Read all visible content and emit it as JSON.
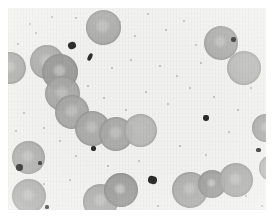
{
  "image": {
    "title": "Peripheral blood smear micrograph",
    "subject": "Red blood cells (erythrocytes)",
    "modality": "Brightfield light microscopy",
    "rendering": "grayscale",
    "width": 274,
    "height": 220,
    "field": {
      "x": 8,
      "y": 8,
      "width": 258,
      "height": 202
    },
    "colors": {
      "page_background": "#ffffff",
      "field_background": "#f1f1ef",
      "cell_fill": "#a9a9a7",
      "cell_fill_light": "#b9b9b7",
      "cell_rim": "#8d8d8b",
      "cell_center_pallor": "#bcbcba",
      "debris_dark": "#2a2a2a",
      "speck_gray": "#9d9d9b"
    }
  },
  "cells": [
    {
      "name": "cell-top-chain-head",
      "cx": 103,
      "cy": 27,
      "r": 17.5,
      "tone": "mid",
      "pallor": 0.52,
      "rot": -8
    },
    {
      "name": "cell-left-edge-upper",
      "cx": 10,
      "cy": 68,
      "r": 16.0,
      "tone": "mid",
      "pallor": 0.5,
      "rot": 12
    },
    {
      "name": "cell-chain-1",
      "cx": 47,
      "cy": 62,
      "r": 17.0,
      "tone": "mid",
      "pallor": 0.55,
      "rot": 0
    },
    {
      "name": "cell-chain-2",
      "cx": 60,
      "cy": 72,
      "r": 18.0,
      "tone": "dark",
      "pallor": 0.45,
      "rot": 5
    },
    {
      "name": "cell-chain-3",
      "cx": 62,
      "cy": 93,
      "r": 17.5,
      "tone": "mid",
      "pallor": 0.5,
      "rot": -6
    },
    {
      "name": "cell-chain-4",
      "cx": 72,
      "cy": 112,
      "r": 17.0,
      "tone": "mid",
      "pallor": 0.52,
      "rot": 10
    },
    {
      "name": "cell-chain-5",
      "cx": 92,
      "cy": 128,
      "r": 17.5,
      "tone": "mid",
      "pallor": 0.48,
      "rot": -4
    },
    {
      "name": "cell-chain-6",
      "cx": 116,
      "cy": 134,
      "r": 17.0,
      "tone": "mid",
      "pallor": 0.52,
      "rot": 6
    },
    {
      "name": "cell-chain-7",
      "cx": 140,
      "cy": 130,
      "r": 16.5,
      "tone": "light",
      "pallor": 0.55,
      "rot": 0
    },
    {
      "name": "cell-right-edge-mid",
      "cx": 266,
      "cy": 128,
      "r": 14.0,
      "tone": "mid",
      "pallor": 0.5,
      "rot": 0
    },
    {
      "name": "cell-upper-right-1",
      "cx": 221,
      "cy": 43,
      "r": 17.0,
      "tone": "mid",
      "pallor": 0.45,
      "rot": -10
    },
    {
      "name": "cell-upper-right-2",
      "cx": 244,
      "cy": 68,
      "r": 17.0,
      "tone": "light",
      "pallor": 0.58,
      "rot": 8
    },
    {
      "name": "cell-left-lower-1",
      "cx": 28,
      "cy": 157,
      "r": 16.5,
      "tone": "mid",
      "pallor": 0.5,
      "rot": 0
    },
    {
      "name": "cell-left-lower-2",
      "cx": 29,
      "cy": 196,
      "r": 17.0,
      "tone": "mid",
      "pallor": 0.48,
      "rot": -5
    },
    {
      "name": "cell-bottom-mid-1",
      "cx": 100,
      "cy": 201,
      "r": 17.5,
      "tone": "mid",
      "pallor": 0.5,
      "rot": 14
    },
    {
      "name": "cell-bottom-mid-2",
      "cx": 121,
      "cy": 190,
      "r": 17.0,
      "tone": "dark",
      "pallor": 0.42,
      "rot": -12
    },
    {
      "name": "cell-bottom-right-1",
      "cx": 190,
      "cy": 190,
      "r": 18.0,
      "tone": "mid",
      "pallor": 0.46,
      "rot": 6
    },
    {
      "name": "cell-bottom-right-2",
      "cx": 212,
      "cy": 184,
      "r": 14.0,
      "tone": "dark",
      "pallor": 0.4,
      "rot": 0
    },
    {
      "name": "cell-bottom-right-3",
      "cx": 236,
      "cy": 180,
      "r": 17.0,
      "tone": "mid",
      "pallor": 0.5,
      "rot": -8
    },
    {
      "name": "cell-right-edge-lower",
      "cx": 272,
      "cy": 168,
      "r": 13.0,
      "tone": "light",
      "pallor": 0.55,
      "rot": 0
    }
  ],
  "debris": [
    {
      "name": "debris-large-upper",
      "cx": 72,
      "cy": 45,
      "w": 8,
      "h": 7,
      "rot": -20,
      "shade": "#232323"
    },
    {
      "name": "debris-streak-upper",
      "cx": 90,
      "cy": 57,
      "w": 4,
      "h": 8,
      "rot": 25,
      "shade": "#2e2e2e"
    },
    {
      "name": "debris-square-left",
      "cx": 19,
      "cy": 167,
      "w": 7,
      "h": 7,
      "rot": 0,
      "shade": "#1f1f1f"
    },
    {
      "name": "debris-mid-right",
      "cx": 152,
      "cy": 180,
      "w": 9,
      "h": 8,
      "rot": 10,
      "shade": "#242424"
    },
    {
      "name": "debris-upper-right",
      "cx": 206,
      "cy": 118,
      "w": 6,
      "h": 6,
      "rot": 0,
      "shade": "#2a2a2a"
    },
    {
      "name": "debris-top-right",
      "cx": 233,
      "cy": 39,
      "w": 5,
      "h": 5,
      "rot": 0,
      "shade": "#303030"
    },
    {
      "name": "debris-right-mid",
      "cx": 258,
      "cy": 150,
      "w": 5,
      "h": 4,
      "rot": 0,
      "shade": "#2b2b2b"
    },
    {
      "name": "debris-lower-left",
      "cx": 40,
      "cy": 163,
      "w": 4,
      "h": 4,
      "rot": 0,
      "shade": "#333333"
    },
    {
      "name": "debris-center-low",
      "cx": 93,
      "cy": 148,
      "w": 5,
      "h": 5,
      "rot": 0,
      "shade": "#2c2c2c"
    },
    {
      "name": "debris-bottom-left",
      "cx": 47,
      "cy": 207,
      "w": 4,
      "h": 4,
      "rot": 0,
      "shade": "#3a3a3a"
    }
  ],
  "specks": [
    {
      "cx": 30,
      "cy": 24,
      "r": 1.4
    },
    {
      "cx": 52,
      "cy": 17,
      "r": 1.1
    },
    {
      "cx": 76,
      "cy": 18,
      "r": 1.0
    },
    {
      "cx": 18,
      "cy": 44,
      "r": 1.2
    },
    {
      "cx": 36,
      "cy": 33,
      "r": 1.0
    },
    {
      "cx": 120,
      "cy": 22,
      "r": 1.2
    },
    {
      "cx": 135,
      "cy": 36,
      "r": 1.1
    },
    {
      "cx": 148,
      "cy": 14,
      "r": 1.0
    },
    {
      "cx": 166,
      "cy": 30,
      "r": 1.3
    },
    {
      "cx": 184,
      "cy": 21,
      "r": 1.0
    },
    {
      "cx": 196,
      "cy": 45,
      "r": 1.2
    },
    {
      "cx": 201,
      "cy": 63,
      "r": 1.1
    },
    {
      "cx": 177,
      "cy": 76,
      "r": 1.0
    },
    {
      "cx": 160,
      "cy": 66,
      "r": 1.2
    },
    {
      "cx": 131,
      "cy": 60,
      "r": 1.1
    },
    {
      "cx": 112,
      "cy": 68,
      "r": 1.0
    },
    {
      "cx": 146,
      "cy": 92,
      "r": 1.2
    },
    {
      "cx": 168,
      "cy": 104,
      "r": 1.1
    },
    {
      "cx": 190,
      "cy": 88,
      "r": 1.0
    },
    {
      "cx": 214,
      "cy": 97,
      "r": 1.2
    },
    {
      "cx": 238,
      "cy": 110,
      "r": 1.1
    },
    {
      "cx": 251,
      "cy": 88,
      "r": 1.0
    },
    {
      "cx": 229,
      "cy": 132,
      "r": 1.2
    },
    {
      "cx": 246,
      "cy": 196,
      "r": 1.1
    },
    {
      "cx": 262,
      "cy": 206,
      "r": 1.0
    },
    {
      "cx": 206,
      "cy": 155,
      "r": 1.1
    },
    {
      "cx": 180,
      "cy": 146,
      "r": 1.0
    },
    {
      "cx": 158,
      "cy": 206,
      "r": 1.2
    },
    {
      "cx": 139,
      "cy": 161,
      "r": 1.0
    },
    {
      "cx": 108,
      "cy": 166,
      "r": 1.1
    },
    {
      "cx": 76,
      "cy": 156,
      "r": 1.0
    },
    {
      "cx": 60,
      "cy": 141,
      "r": 1.2
    },
    {
      "cx": 44,
      "cy": 128,
      "r": 1.1
    },
    {
      "cx": 24,
      "cy": 113,
      "r": 1.0
    },
    {
      "cx": 16,
      "cy": 131,
      "r": 1.2
    },
    {
      "cx": 88,
      "cy": 86,
      "r": 1.0
    },
    {
      "cx": 104,
      "cy": 98,
      "r": 1.1
    },
    {
      "cx": 126,
      "cy": 110,
      "r": 1.0
    },
    {
      "cx": 44,
      "cy": 184,
      "r": 1.1
    },
    {
      "cx": 70,
      "cy": 180,
      "r": 1.0
    }
  ]
}
